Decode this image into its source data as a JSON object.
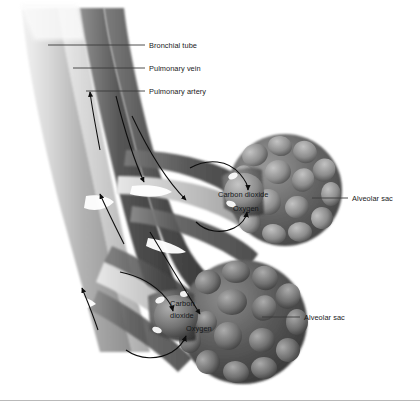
{
  "figure": {
    "background_color": "#ffffff",
    "ink_color": "#1a1a1a",
    "style": "grayscale medical illustration"
  },
  "labels": {
    "bronchial_tube": "Bronchial tube",
    "pulmonary_vein": "Pulmonary vein",
    "pulmonary_artery": "Pulmonary artery",
    "alveolar_sac_upper": "Alveolar sac",
    "alveolar_sac_lower": "Alveolar sac",
    "carbon_dioxide_upper": "Carbon dioxide",
    "oxygen_upper": "Oxygen",
    "carbon_dioxide_lower_line1": "Carbon",
    "carbon_dioxide_lower_line2": "dioxide",
    "oxygen_lower": "Oxygen"
  },
  "structures": [
    {
      "name": "bronchial-tube",
      "tone": "#b4b4b4"
    },
    {
      "name": "pulmonary-vein",
      "tone": "#6d6d6d"
    },
    {
      "name": "pulmonary-artery",
      "tone": "#4f4f4f"
    },
    {
      "name": "alveolar-sac-upper",
      "tone": "#5a5a5a"
    },
    {
      "name": "alveolar-sac-lower",
      "tone": "#4a4a4a"
    }
  ],
  "flow_arrows": {
    "count": 8,
    "description": "directional blood flow and gas exchange arrows"
  }
}
